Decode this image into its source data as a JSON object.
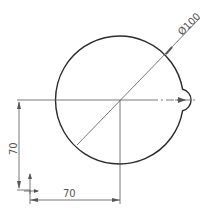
{
  "drawing": {
    "diameter_label": "Ø100",
    "vertical_dim_label": "70",
    "horizontal_dim_label": "70",
    "colors": {
      "outline": "#2b2b2b",
      "dimension": "#555555",
      "background": "#ffffff"
    }
  }
}
